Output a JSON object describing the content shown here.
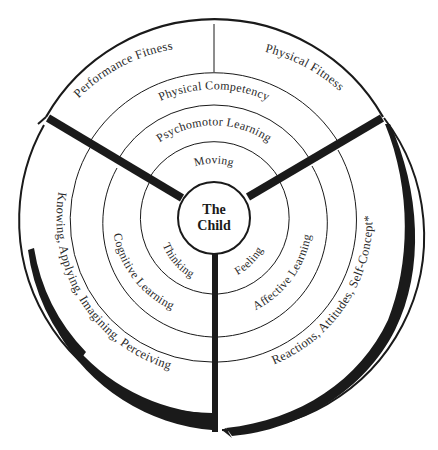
{
  "diagram": {
    "center": {
      "line1": "The",
      "line2": "Child"
    },
    "top_section": {
      "inner": "Moving",
      "middle": "Psychomotor Learning",
      "competency": "Physical Competency",
      "outer_left": "Performance Fitness",
      "outer_right": "Physical Fitness"
    },
    "left_section": {
      "inner": "Thinking",
      "middle": "Cognitive Learning",
      "outer": "Knowing, Applying, Imagining, Perceiving*"
    },
    "right_section": {
      "inner": "Feeling",
      "middle": "Affective Learning",
      "outer": "Reactions, Attitudes, Self-Concept*"
    },
    "colors": {
      "line": "#1a1a1a",
      "text": "#2a2a2a",
      "background": "#ffffff"
    }
  }
}
